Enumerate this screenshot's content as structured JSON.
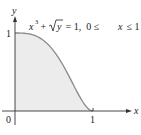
{
  "chart_data": {
    "type": "area",
    "title": "",
    "equation_label": "x³ + √y = 1, 0 ≤ x ≤ 1",
    "function": "y = (1 - x^3)^2",
    "xlabel": "x",
    "ylabel": "y",
    "x_ticks": [
      "0",
      "1"
    ],
    "y_ticks": [
      "1"
    ],
    "origin_label": "0",
    "xlim": [
      0,
      1.45
    ],
    "ylim": [
      0,
      1.2
    ],
    "grid": false,
    "legend": "none",
    "x": [
      0,
      0.1,
      0.2,
      0.3,
      0.4,
      0.5,
      0.6,
      0.7,
      0.8,
      0.9,
      1.0
    ],
    "values": [
      1.0,
      0.998,
      0.984,
      0.946,
      0.874,
      0.766,
      0.615,
      0.431,
      0.237,
      0.073,
      0.0
    ],
    "fill_color": "#ececec",
    "curve_color": "#8a8a8a",
    "axis_color": "#333333"
  },
  "labels": {
    "y_axis": "y",
    "x_axis": "x",
    "origin": "0",
    "x_tick_1": "1",
    "y_tick_1": "1",
    "eq_x": "x",
    "eq_exp": "3",
    "eq_plus": " + ",
    "eq_y": "y",
    "eq_rest1": " = 1,  0 ≤ ",
    "eq_x2": "x",
    "eq_rest2": " ≤ 1"
  }
}
